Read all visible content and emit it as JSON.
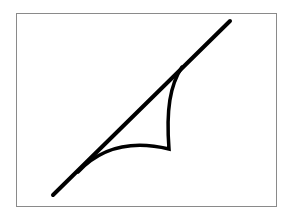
{
  "figure": {
    "width": 293,
    "height": 219,
    "background": "#ffffff",
    "frame": {
      "x": 16,
      "y": 13,
      "width": 260,
      "height": 193,
      "stroke": "#8a8a8a",
      "stroke_width": 1
    },
    "tangent_line": {
      "x1": 53,
      "y1": 195,
      "x2": 230,
      "y2": 21,
      "stroke": "#000000",
      "stroke_width": 4
    },
    "cusp_curve": {
      "d": "M 182 67 C 170 85, 166 110, 169 149 C 140 142, 105 143, 78 172",
      "stroke": "#000000",
      "stroke_width": 3.5
    }
  }
}
